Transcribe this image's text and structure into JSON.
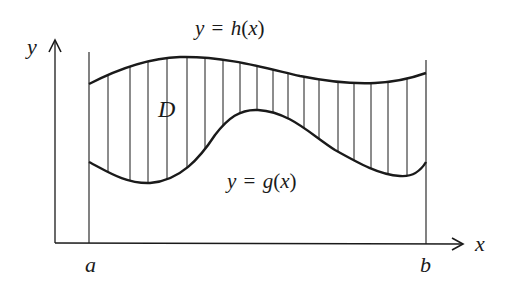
{
  "diagram": {
    "type": "region-between-curves",
    "colors": {
      "stroke": "#1a1a1a",
      "background": "#ffffff"
    },
    "axes": {
      "x_label": "x",
      "y_label": "y"
    },
    "bounds": {
      "left_label": "a",
      "right_label": "b"
    },
    "curves": {
      "upper": {
        "label_y": "y",
        "label_eq": "=",
        "label_fn": "h",
        "label_open": "(",
        "label_var": "x",
        "label_close": ")",
        "label_text": "y = h(x)"
      },
      "lower": {
        "label_y": "y",
        "label_eq": "=",
        "label_fn": "g",
        "label_open": "(",
        "label_var": "x",
        "label_close": ")",
        "label_text": "y = g(x)"
      }
    },
    "region": {
      "label": "D",
      "hatching": "vertical lines",
      "hatch_x": [
        108,
        130,
        148,
        167,
        187,
        205,
        223,
        240,
        257,
        273,
        288,
        304,
        319,
        338,
        354,
        371,
        388,
        407
      ]
    }
  }
}
